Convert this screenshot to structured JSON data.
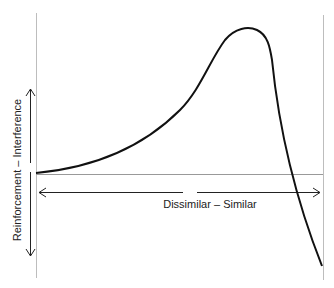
{
  "diagram": {
    "x_axis_label": "Dissimilar – Similar",
    "y_axis_label": "Reinforcement – Interference",
    "colors": {
      "curve": "#111111",
      "axis_lines": "#bbbbbb",
      "arrows": "#222222"
    }
  }
}
